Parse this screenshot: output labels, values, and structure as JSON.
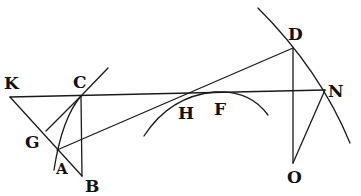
{
  "figure": {
    "type": "geometric-construction",
    "colors": {
      "ink": "#1a1a1a",
      "background": "#ffffff"
    },
    "points": {
      "K": {
        "label": "K",
        "x": 10,
        "y": 97,
        "lx": 4,
        "ly": 89
      },
      "C": {
        "label": "C",
        "x": 81,
        "y": 96,
        "lx": 73,
        "ly": 88
      },
      "G": {
        "label": "G",
        "x": 46,
        "y": 130,
        "lx": 25,
        "ly": 148
      },
      "A": {
        "label": "A",
        "x": 57,
        "y": 150,
        "lx": 56,
        "ly": 174
      },
      "B": {
        "label": "B",
        "x": 82,
        "y": 176,
        "lx": 85,
        "ly": 192
      },
      "H": {
        "label": "H",
        "x": 205,
        "y": 93,
        "lx": 176,
        "ly": 119
      },
      "F": {
        "label": "F",
        "x": 245,
        "y": 95,
        "lx": 214,
        "ly": 115
      },
      "D": {
        "label": "D",
        "x": 293,
        "y": 48,
        "lx": 290,
        "ly": 40
      },
      "N": {
        "label": "N",
        "x": 325,
        "y": 90,
        "lx": 328,
        "ly": 97
      },
      "O": {
        "label": "O",
        "x": 293,
        "y": 163,
        "lx": 286,
        "ly": 182
      }
    },
    "labels": [
      "K",
      "C",
      "G",
      "A",
      "B",
      "H",
      "F",
      "D",
      "N",
      "O"
    ]
  }
}
